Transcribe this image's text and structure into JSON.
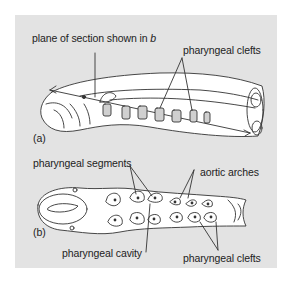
{
  "figure": {
    "background_color": "#e3e3e3",
    "line_color": "#333333",
    "panel_a": {
      "tag": "(a)",
      "labels": {
        "plane": "plane of section shown in ",
        "plane_ref": "b",
        "clefts": "pharyngeal clefts"
      }
    },
    "panel_b": {
      "tag": "(b)",
      "labels": {
        "segments": "pharyngeal segments",
        "aortic": "aortic arches",
        "cavity": "pharyngeal cavity",
        "clefts": "pharyngeal clefts"
      }
    }
  }
}
